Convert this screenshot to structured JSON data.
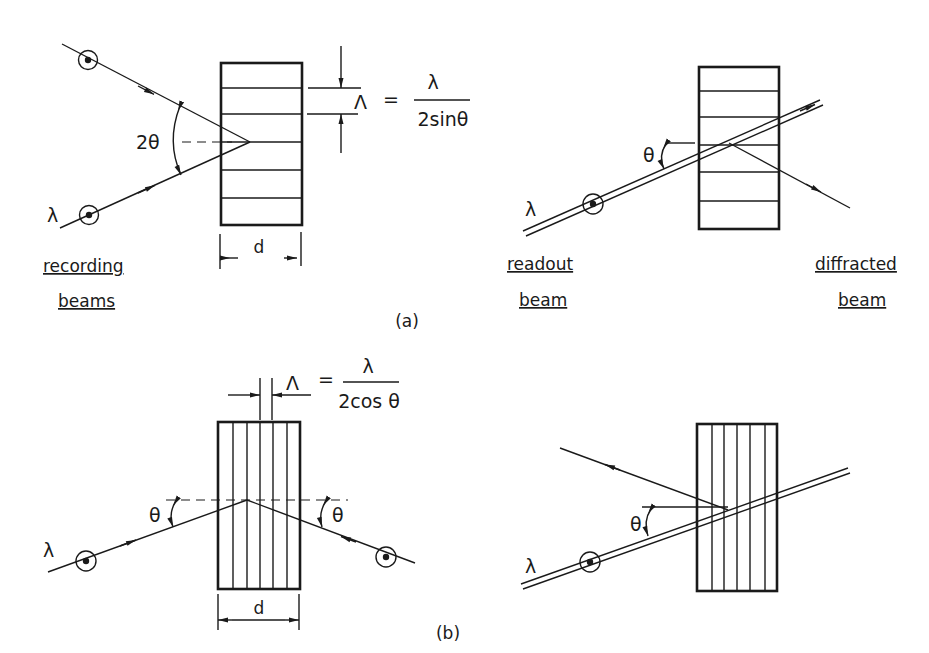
{
  "figure": {
    "panel_a": {
      "tag": "(a)",
      "recording": {
        "wavelength_label": "λ",
        "angle_label": "2θ",
        "period_symbol": "Λ",
        "equals": "=",
        "formula_numerator": "λ",
        "formula_denominator": "2sinθ",
        "thickness_label": "d",
        "caption_line1": "recording",
        "caption_line2": "beams",
        "fringe_orientation": "horizontal"
      },
      "readout": {
        "wavelength_label": "λ",
        "angle_label": "θ",
        "readout_caption_line1": "readout",
        "readout_caption_line2": "beam",
        "diffracted_caption_line1": "diffracted",
        "diffracted_caption_line2": "beam"
      }
    },
    "panel_b": {
      "tag": "(b)",
      "recording": {
        "wavelength_label": "λ",
        "angle_left_label": "θ",
        "angle_right_label": "θ",
        "period_symbol": "Λ",
        "equals": "=",
        "formula_numerator": "λ",
        "formula_denominator": "2cos θ",
        "thickness_label": "d",
        "fringe_orientation": "vertical"
      },
      "readout": {
        "wavelength_label": "λ",
        "angle_label": "θ"
      }
    },
    "colors": {
      "ink": "#1a1a1a",
      "background": "#ffffff"
    }
  }
}
